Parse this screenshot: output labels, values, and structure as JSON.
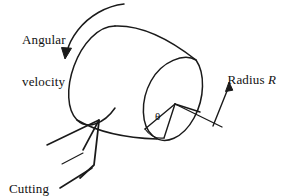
{
  "figure": {
    "type": "engineering-sketch",
    "background_color": "#ffffff",
    "ink_color": "#1a1a1a",
    "labels": {
      "angular_velocity_line1": "Angular",
      "angular_velocity_line2": "velocity",
      "radius_word": "Radius ",
      "radius_symbol": "R",
      "cutting_tool_line1": "Cutting",
      "cutting_tool_line2": "tool",
      "angle_symbol": "θ"
    },
    "annotations": {
      "angular_velocity_arrow": "curved arrow indicating rotation direction",
      "radius_arrow": "straight arrow pointing to cylinder radius",
      "cutting_tool_pointer": "wedge shape touching cylinder surface"
    }
  }
}
